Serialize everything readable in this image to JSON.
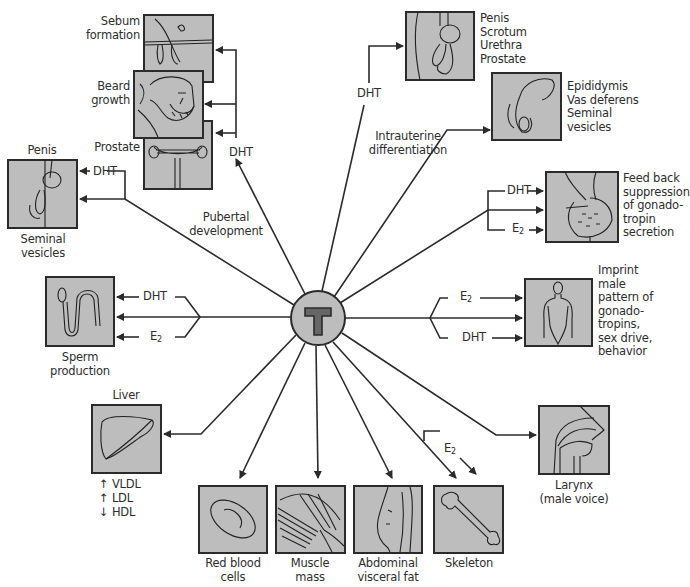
{
  "diagram": {
    "center": {
      "label": "T",
      "fill": "#bdbdbd",
      "glyph_fill": "#666666"
    },
    "colors": {
      "box_fill": "#bdbdbd",
      "stroke": "#2b2b2b",
      "text": "#2e2e2e",
      "background": "#ffffff"
    },
    "pathway_labels": {
      "pubertal": "Pubertal\ndevelopment",
      "intrauterine": "Intrauterine\ndifferentiation"
    },
    "metabolites": {
      "dht": "DHT",
      "e2_base": "E",
      "e2_sub": "2"
    },
    "targets": {
      "sebum": {
        "label": "Sebum\nformation",
        "mediator": "DHT",
        "icon": "hair-follicle-icon"
      },
      "beard": {
        "label": "Beard\ngrowth",
        "mediator": "DHT",
        "icon": "bearded-face-icon"
      },
      "prostate_pubertal": {
        "label": "Prostate",
        "mediator": "DHT",
        "icon": "prostate-icon"
      },
      "penis_pubertal": {
        "label_top": "Penis",
        "label_bottom": "Seminal\nvesicles",
        "mediator": "DHT",
        "icon": "penis-icon"
      },
      "sperm": {
        "label": "Sperm\nproduction",
        "mediators": [
          "DHT",
          "T",
          "E2"
        ],
        "icon": "sperm-icon"
      },
      "liver": {
        "label": "Liver",
        "effects": [
          "↑ VLDL",
          "↑ LDL",
          "↓ HDL"
        ],
        "icon": "liver-icon"
      },
      "rbc": {
        "label": "Red blood\ncells",
        "icon": "red-blood-cell-icon"
      },
      "muscle": {
        "label": "Muscle\nmass",
        "icon": "muscle-icon"
      },
      "abdominal": {
        "label": "Abdominal\nvisceral fat",
        "icon": "abdomen-icon"
      },
      "skeleton": {
        "label": "Skeleton",
        "mediators": [
          "T",
          "E2"
        ],
        "icon": "bone-icon"
      },
      "larynx": {
        "label": "Larynx\n(male voice)",
        "icon": "larynx-icon"
      },
      "imprint": {
        "label": "Imprint\nmale\npattern of\ngonado-\ntropins,\nsex drive,\nbehavior",
        "mediators": [
          "E2",
          "T",
          "DHT"
        ],
        "icon": "male-figure-icon"
      },
      "feedback": {
        "label": "Feed back\nsuppression\nof gonado-\ntropin\nsecretion",
        "mediators": [
          "DHT",
          "T",
          "E2"
        ],
        "icon": "pituitary-icon"
      },
      "epididymis": {
        "label": "Epididymis\nVas deferens\nSeminal\nvesicles",
        "mediator": "T",
        "icon": "epididymis-icon"
      },
      "external_genitalia": {
        "label": "Penis\nScrotum\nUrethra\nProstate",
        "mediator": "DHT",
        "icon": "genitalia-icon"
      }
    }
  }
}
